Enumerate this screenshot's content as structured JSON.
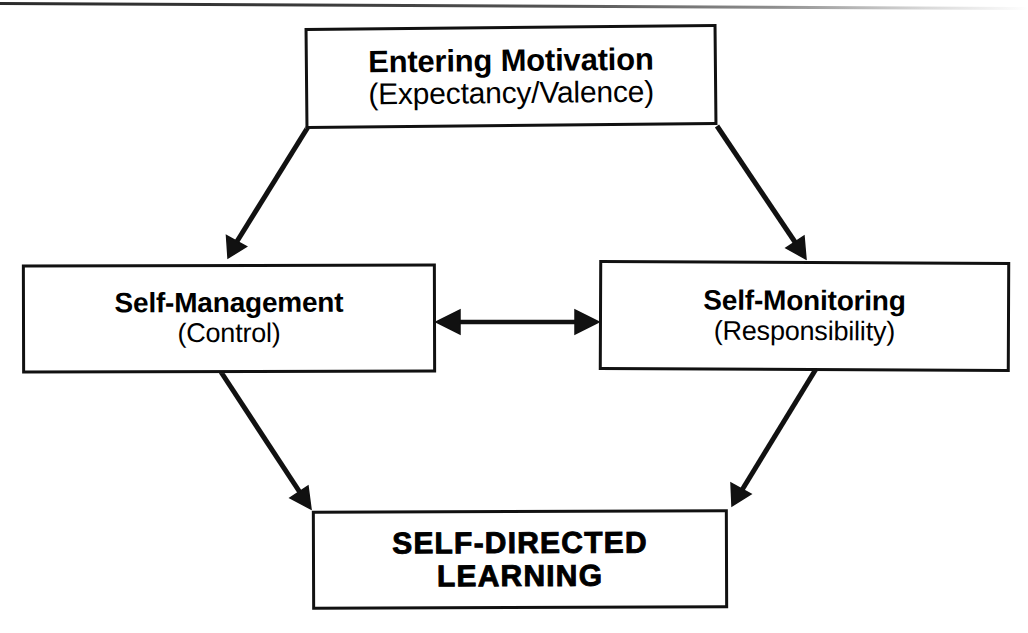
{
  "diagram": {
    "background_color": "#ffffff",
    "stroke_color": "#111111",
    "text_color": "#000000",
    "nodes": [
      {
        "id": "entering-motivation",
        "primary": "Entering Motivation",
        "secondary": "(Expectancy/Valence)"
      },
      {
        "id": "self-management",
        "primary": "Self-Management",
        "secondary": "(Control)"
      },
      {
        "id": "self-monitoring",
        "primary": "Self-Monitoring",
        "secondary": "(Responsibility)"
      },
      {
        "id": "self-directed-learning",
        "primary_line1": "SELF-DIRECTED",
        "primary_line2": "LEARNING"
      }
    ],
    "connectors": [
      {
        "id": "motivation-to-self-management",
        "from": "entering-motivation",
        "to": "self-management",
        "direction": "one-way",
        "style": "solid"
      },
      {
        "id": "motivation-to-self-monitoring",
        "from": "entering-motivation",
        "to": "self-monitoring",
        "direction": "one-way",
        "style": "solid"
      },
      {
        "id": "self-management-to-self-monitoring",
        "from": "self-management",
        "to": "self-monitoring",
        "direction": "two-way",
        "style": "solid"
      },
      {
        "id": "self-management-to-learning",
        "from": "self-management",
        "to": "self-directed-learning",
        "direction": "one-way",
        "style": "solid"
      },
      {
        "id": "self-monitoring-to-learning",
        "from": "self-monitoring",
        "to": "self-directed-learning",
        "direction": "one-way",
        "style": "solid"
      }
    ]
  }
}
